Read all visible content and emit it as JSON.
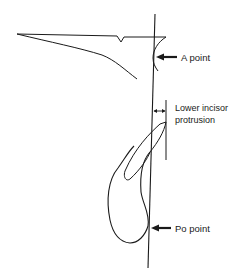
{
  "diagram": {
    "type": "cephalometric-tracing",
    "labels": {
      "a_point": "A point",
      "lower_incisor_line1": "Lower incisor",
      "lower_incisor_line2": "protrusion",
      "po_point": "Po point"
    },
    "colors": {
      "stroke": "#1a1a1a",
      "background": "#ffffff"
    }
  }
}
